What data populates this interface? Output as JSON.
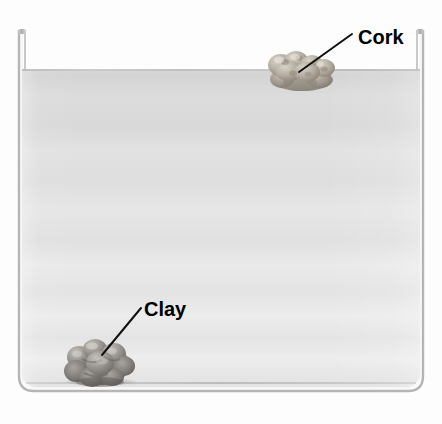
{
  "figure": {
    "title": "",
    "ghost_artifact_text": "                   ",
    "background_color": "#fdfdfd"
  },
  "container": {
    "name": "water-container",
    "wall_color": "#b9b9b9",
    "wall_highlight_color": "#f4f4f4",
    "corner_radius": 14
  },
  "water": {
    "name": "water-body",
    "surface_color": "#bfbfbf",
    "top_color": "#d6d6d6",
    "bottom_color": "#e8e8e8",
    "surface_y": 70
  },
  "objects": [
    {
      "id": "cork",
      "label": "Cork",
      "state": "floating",
      "position": "water-surface-right",
      "color": "#b4aca0",
      "shadow_color": "#8d857a",
      "label_x": 358,
      "label_y": 26,
      "leader_from": [
        352,
        34
      ],
      "leader_to": [
        299,
        72
      ]
    },
    {
      "id": "clay",
      "label": "Clay",
      "state": "sunken",
      "position": "container-bottom-left",
      "color": "#9c9894",
      "shadow_color": "#6e6a66",
      "label_x": 144,
      "label_y": 298,
      "leader_from": [
        141,
        308
      ],
      "leader_to": [
        102,
        355
      ]
    }
  ],
  "leader_line": {
    "color": "#111111",
    "width": 2
  }
}
